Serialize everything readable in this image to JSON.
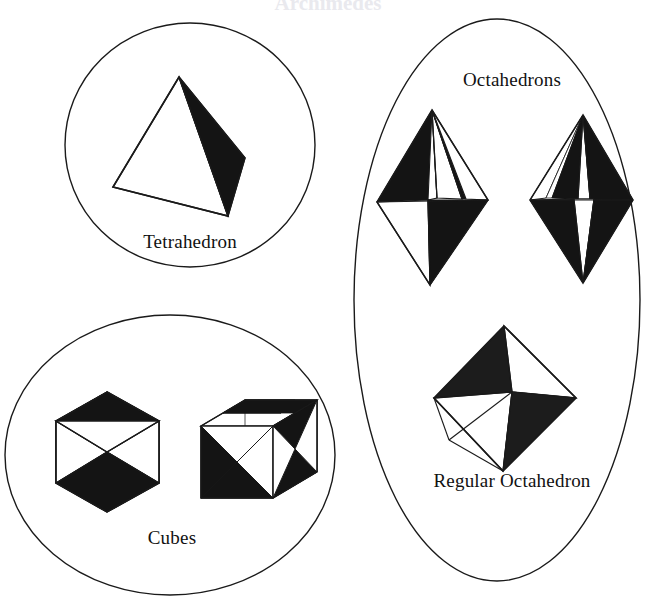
{
  "figure": {
    "title": "Archimedes",
    "background_color": "#ffffff",
    "stroke_color": "#1a1a1a",
    "fill_black": "#141414",
    "fill_white": "#ffffff",
    "width": 657,
    "height": 599
  },
  "groups": [
    {
      "id": "tetrahedron-group",
      "label": "Tetrahedron",
      "outline": "circle",
      "cx": 190,
      "cy": 145,
      "rx": 125,
      "ry": 122
    },
    {
      "id": "octahedrons-group",
      "label": "Octahedrons",
      "sublabel": "Regular Octahedron",
      "outline": "ellipse",
      "cx": 497,
      "cy": 300,
      "rx": 143,
      "ry": 281
    },
    {
      "id": "cubes-group",
      "label": "Cubes",
      "outline": "ellipse",
      "cx": 170,
      "cy": 455,
      "rx": 165,
      "ry": 140
    }
  ],
  "labels": {
    "tetrahedron": "Tetrahedron",
    "octahedrons": "Octahedrons",
    "regular_octahedron": "Regular Octahedron",
    "cubes": "Cubes"
  },
  "solids": [
    {
      "name": "tetrahedron",
      "kind": "tetrahedron",
      "faces_visible": 2,
      "shaded_faces": 1
    },
    {
      "name": "octahedron-left",
      "kind": "octahedron",
      "orientation": "elongated-tilted",
      "shaded_faces": 4
    },
    {
      "name": "octahedron-right",
      "kind": "octahedron",
      "orientation": "elongated-symmetric",
      "shaded_faces": 4
    },
    {
      "name": "regular-octahedron",
      "kind": "octahedron",
      "orientation": "regular",
      "shaded_faces": 2
    },
    {
      "name": "cube-left",
      "kind": "cube",
      "orientation": "body-diagonal-hexagonal",
      "shaded_faces": 2
    },
    {
      "name": "cube-right",
      "kind": "cube",
      "orientation": "three-quarter-with-inscribed-octahedron",
      "shaded_faces": 6
    }
  ]
}
